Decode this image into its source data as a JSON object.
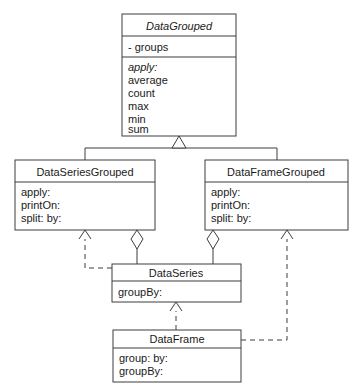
{
  "diagram": {
    "kind": "uml-class-diagram",
    "background_color": "#ffffff",
    "line_color": "#3c3c3c",
    "text_color": "#1a1a1a",
    "classes": [
      {
        "id": "data-grouped",
        "name": "DataGrouped",
        "abstract": true,
        "attributes": [
          "- groups"
        ],
        "operations": [
          "apply:",
          "average",
          "count",
          "max",
          "min",
          "sum"
        ],
        "abstract_operations": [
          "apply:"
        ]
      },
      {
        "id": "data-series-grouped",
        "name": "DataSeriesGrouped",
        "abstract": false,
        "attributes": [],
        "operations": [
          "apply:",
          "printOn:",
          "split: by:"
        ],
        "abstract_operations": []
      },
      {
        "id": "data-frame-grouped",
        "name": "DataFrameGrouped",
        "abstract": false,
        "attributes": [],
        "operations": [
          "apply:",
          "printOn:",
          "split: by:"
        ],
        "abstract_operations": []
      },
      {
        "id": "data-series",
        "name": "DataSeries",
        "abstract": false,
        "attributes": [],
        "operations": [
          "groupBy:"
        ],
        "abstract_operations": []
      },
      {
        "id": "data-frame",
        "name": "DataFrame",
        "abstract": false,
        "attributes": [],
        "operations": [
          "group: by:",
          "groupBy:"
        ],
        "abstract_operations": []
      }
    ],
    "relationships": [
      {
        "id": "gen-dsg-dg",
        "type": "generalization",
        "from": "DataSeriesGrouped",
        "to": "DataGrouped",
        "line": "solid",
        "marker": "hollow-triangle"
      },
      {
        "id": "gen-dfg-dg",
        "type": "generalization",
        "from": "DataFrameGrouped",
        "to": "DataGrouped",
        "line": "solid",
        "marker": "hollow-triangle"
      },
      {
        "id": "agg-dsg-ds",
        "type": "aggregation",
        "from": "DataSeriesGrouped",
        "to": "DataSeries",
        "line": "solid",
        "marker": "hollow-diamond"
      },
      {
        "id": "agg-dfg-ds",
        "type": "aggregation",
        "from": "DataFrameGrouped",
        "to": "DataSeries",
        "line": "solid",
        "marker": "hollow-diamond"
      },
      {
        "id": "dep-ds-dsg",
        "type": "dependency",
        "from": "DataSeries",
        "to": "DataSeriesGrouped",
        "line": "dashed",
        "marker": "open-arrow"
      },
      {
        "id": "dep-df-dfg",
        "type": "dependency",
        "from": "DataFrame",
        "to": "DataFrameGrouped",
        "line": "dashed",
        "marker": "open-arrow"
      },
      {
        "id": "dep-df-ds",
        "type": "dependency",
        "from": "DataFrame",
        "to": "DataSeries",
        "line": "dashed",
        "marker": "open-arrow"
      }
    ]
  }
}
